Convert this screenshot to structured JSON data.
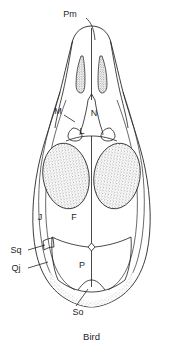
{
  "figure": {
    "caption": "Bird",
    "view": "dorsal",
    "line_color": "#1a1a1a",
    "background_color": "#ffffff",
    "stipple_color": "#4a4a4a"
  },
  "labels": {
    "premaxilla": "Pm",
    "maxilla": "M",
    "nasal": "N",
    "lacrimal": "L",
    "jugal": "J",
    "frontal": "F",
    "parietal": "P",
    "squamosal": "Sq",
    "quadratojugal": "Qj",
    "supraoccipital": "So"
  }
}
